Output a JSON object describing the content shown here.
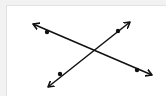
{
  "diagram": {
    "colors": {
      "background": "#ffffff",
      "ink": "#111111",
      "outer": "#f2f2f2"
    },
    "lines": [
      {
        "id": "line-1",
        "from": [
          33,
          24
        ],
        "to": [
          152,
          75
        ],
        "points": [
          [
            47,
            32
          ],
          [
            137,
            70
          ]
        ]
      },
      {
        "id": "line-2",
        "from": [
          48,
          87
        ],
        "to": [
          130,
          22
        ],
        "points": [
          [
            60,
            74
          ],
          [
            118,
            31
          ]
        ]
      }
    ],
    "intersection": [
      92,
      49
    ]
  }
}
